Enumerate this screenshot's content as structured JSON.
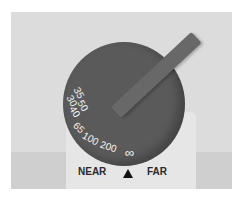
{
  "dial": {
    "scale_marks": [
      "30",
      "35",
      "40",
      "50",
      "65",
      "100",
      "200",
      "∞"
    ],
    "near_label": "NEAR",
    "far_label": "FAR",
    "index_marker": "▲"
  },
  "colors": {
    "background": "#dcdcdc",
    "dial": "#5a5a5a",
    "scale_text": "#f4f4f4",
    "label_text": "#2a2a2a"
  }
}
